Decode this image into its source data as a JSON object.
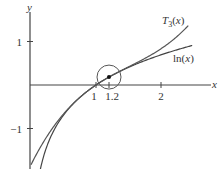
{
  "chart_data": {
    "type": "line",
    "title": "",
    "xlabel": "x",
    "ylabel": "y",
    "xlim": [
      0,
      2.6
    ],
    "ylim": [
      -1.95,
      1.75
    ],
    "grid": false,
    "x_ticks": [
      {
        "value": 1,
        "label": "1"
      },
      {
        "value": 1.2,
        "label": "1.2"
      },
      {
        "value": 2,
        "label": "2"
      }
    ],
    "y_ticks": [
      {
        "value": 1,
        "label": "1"
      },
      {
        "value": -1,
        "label": "−1"
      }
    ],
    "series": [
      {
        "name": "ln(x)",
        "label_main": "ln(",
        "label_var": "x",
        "label_end": ")",
        "function": "ln(x)",
        "domain": [
          0.12,
          2.48
        ],
        "color": "#444444"
      },
      {
        "name": "T3(x)",
        "label_main": "T",
        "label_sub": "3",
        "label_var": "x",
        "function": "(x-1) - (x-1)^2/2 + (x-1)^3/3",
        "domain": [
          0.0,
          2.42
        ],
        "color": "#555555"
      }
    ],
    "annotations": [
      {
        "type": "point",
        "x": 1.2,
        "y": 0.1823,
        "label": ""
      },
      {
        "type": "circle",
        "center_x": 1.2,
        "center_y": 0.1823,
        "radius_px": 12
      }
    ],
    "legend_position": "inline"
  }
}
